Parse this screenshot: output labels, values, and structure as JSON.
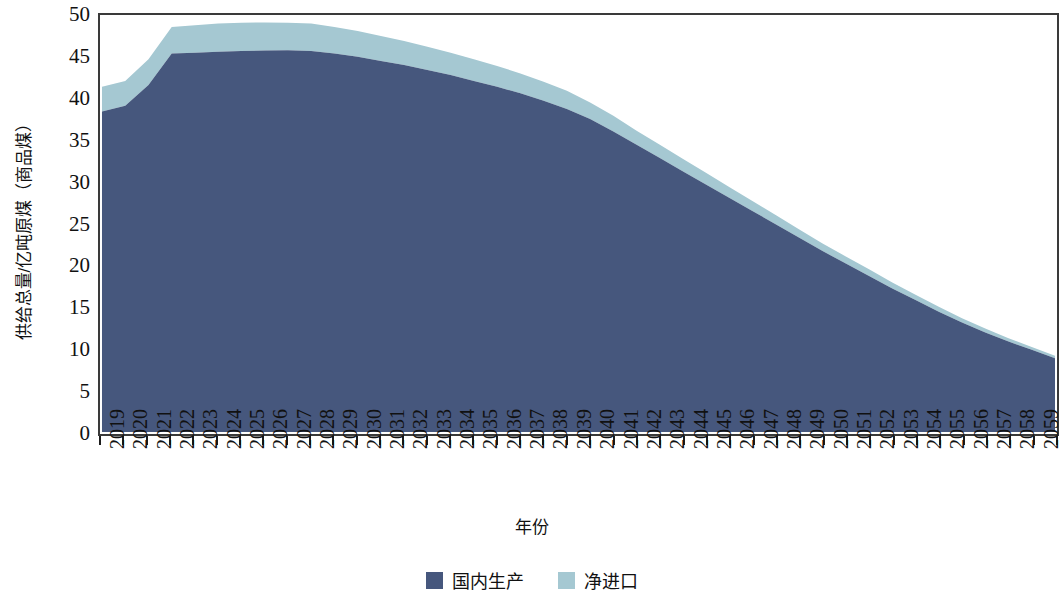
{
  "chart_data": {
    "type": "area",
    "stacked": true,
    "title": "",
    "xlabel": "年份",
    "ylabel": "供给总量/亿吨原煤（商品煤）",
    "grid": false,
    "legend_position": "bottom",
    "xlim": [
      2019,
      2060
    ],
    "ylim": [
      0,
      50
    ],
    "ytick_labels": [
      "0",
      "5",
      "10",
      "15",
      "20",
      "25",
      "30",
      "35",
      "40",
      "45",
      "50"
    ],
    "ytick_values": [
      0,
      5,
      10,
      15,
      20,
      25,
      30,
      35,
      40,
      45,
      50
    ],
    "categories": [
      "2019",
      "2020",
      "2021",
      "2022",
      "2023",
      "2024",
      "2025",
      "2026",
      "2027",
      "2028",
      "2029",
      "2030",
      "2031",
      "2032",
      "2033",
      "2034",
      "2035",
      "2036",
      "2037",
      "2038",
      "2039",
      "2040",
      "2041",
      "2042",
      "2043",
      "2044",
      "2045",
      "2046",
      "2047",
      "2048",
      "2049",
      "2050",
      "2051",
      "2052",
      "2053",
      "2054",
      "2055",
      "2056",
      "2057",
      "2058",
      "2059",
      "2060"
    ],
    "series": [
      {
        "name": "国内生产",
        "color": "#46577d",
        "values": [
          38.6,
          39.3,
          41.8,
          45.6,
          45.7,
          45.8,
          45.9,
          45.95,
          46.0,
          45.9,
          45.6,
          45.2,
          44.7,
          44.2,
          43.6,
          43.0,
          42.3,
          41.6,
          40.8,
          39.9,
          38.9,
          37.7,
          36.2,
          34.6,
          33.0,
          31.4,
          29.8,
          28.2,
          26.6,
          25.0,
          23.4,
          21.8,
          20.3,
          18.8,
          17.3,
          15.9,
          14.5,
          13.2,
          12.0,
          10.9,
          9.9,
          8.9
        ]
      },
      {
        "name": "净进口",
        "color": "#a5c8d2",
        "values": [
          3.0,
          3.0,
          3.1,
          3.2,
          3.3,
          3.4,
          3.4,
          3.4,
          3.3,
          3.3,
          3.2,
          3.1,
          3.0,
          2.9,
          2.8,
          2.7,
          2.6,
          2.5,
          2.4,
          2.3,
          2.2,
          2.0,
          1.9,
          1.7,
          1.6,
          1.5,
          1.4,
          1.3,
          1.2,
          1.1,
          1.0,
          0.9,
          0.85,
          0.8,
          0.72,
          0.65,
          0.58,
          0.52,
          0.46,
          0.4,
          0.34,
          0.3
        ]
      }
    ],
    "totals": [
      41.6,
      42.3,
      44.9,
      48.8,
      49.0,
      49.2,
      49.3,
      49.35,
      49.3,
      49.2,
      48.8,
      48.3,
      47.7,
      47.1,
      46.4,
      45.7,
      44.9,
      44.1,
      43.2,
      42.2,
      41.1,
      39.7,
      38.1,
      36.3,
      34.6,
      32.9,
      31.2,
      29.5,
      27.8,
      26.1,
      24.4,
      22.7,
      21.15,
      19.6,
      18.02,
      16.55,
      15.08,
      13.72,
      12.46,
      11.3,
      10.24,
      9.2
    ]
  },
  "legend": {
    "items": [
      {
        "label": "国内生产",
        "color": "#46577d",
        "swatch": "legend-swatch-domestic"
      },
      {
        "label": "净进口",
        "color": "#a5c8d2",
        "swatch": "legend-swatch-import"
      }
    ]
  }
}
